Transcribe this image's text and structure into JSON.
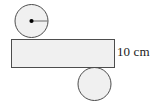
{
  "figure": {
    "kind": "geometry-diagram",
    "background_color": "#ffffff",
    "shape_fill_color": "#f0f0f0",
    "shape_stroke_color": "#4d4d4d",
    "marker_color": "#000000"
  },
  "labels": {
    "dimension": "10 cm"
  },
  "chart_data": {
    "type": "diagram",
    "title": "",
    "shapes": [
      {
        "name": "top-circle",
        "type": "circle",
        "cx": 31.5,
        "cy": 21.0,
        "r": 16.5,
        "fill": "#f0f0f0",
        "stroke": "#4d4d4d",
        "has_center_dot": true,
        "has_radius_line": true,
        "radius_line_angle_deg": 0
      },
      {
        "name": "bar-rectangle",
        "type": "rect",
        "x": 11.0,
        "y": 39.0,
        "width": 104.0,
        "height": 29.0,
        "fill": "#f0f0f0",
        "stroke": "#4d4d4d",
        "label": "10 cm",
        "label_side": "right"
      },
      {
        "name": "bottom-circle",
        "type": "circle",
        "cx": 94.5,
        "cy": 84.0,
        "r": 16.5,
        "fill": "#f0f0f0",
        "stroke": "#4d4d4d",
        "has_center_dot": false,
        "has_radius_line": false
      }
    ],
    "annotations": [
      {
        "name": "height-dimension",
        "text": "10 cm",
        "x": 117,
        "y": 52,
        "refers_to": "bar-rectangle"
      }
    ]
  }
}
